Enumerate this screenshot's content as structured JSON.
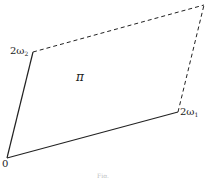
{
  "diagram": {
    "vertices": {
      "origin": {
        "label": "0",
        "x": 7,
        "y": 158
      },
      "omega1": {
        "label_main": "2ω",
        "label_sub": "1",
        "x": 178,
        "y": 112
      },
      "omega2": {
        "label_main": "2ω",
        "label_sub": "2",
        "x": 33,
        "y": 52
      },
      "far": {
        "x": 204,
        "y": 5
      }
    },
    "region_label": "π",
    "edges": [
      {
        "from": "origin",
        "to": "omega1",
        "style": "solid"
      },
      {
        "from": "origin",
        "to": "omega2",
        "style": "solid"
      },
      {
        "from": "omega2",
        "to": "far",
        "style": "dashed"
      },
      {
        "from": "omega1",
        "to": "far",
        "style": "dashed"
      }
    ],
    "caption": "Fig."
  }
}
